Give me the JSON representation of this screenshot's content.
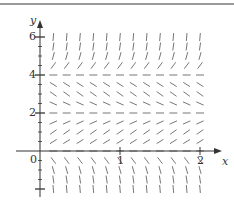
{
  "figure": {
    "type": "slope_field",
    "top_rule_color": "#9a9a9a",
    "axis_color": "#333333",
    "segment_color": "#666666"
  },
  "axes": {
    "x_label": "x",
    "y_label": "y",
    "origin_label": "0",
    "x_ticks": [
      {
        "value": 1,
        "label": "1"
      },
      {
        "value": 2,
        "label": "2"
      }
    ],
    "y_ticks": [
      {
        "value": 2,
        "label": "2"
      },
      {
        "value": 4,
        "label": "4"
      },
      {
        "value": 6,
        "label": "6"
      }
    ],
    "y_minor_step": 0.5
  },
  "chart_data": {
    "type": "slope_field",
    "title": "",
    "xlabel": "x",
    "ylabel": "y",
    "equation": "dy/dx = y(y-2)(y-4)",
    "equilibria": [
      0,
      2,
      4
    ],
    "x_grid": {
      "start": 0.1667,
      "stop": 2.0,
      "step": 0.1667
    },
    "y_grid": {
      "start": -2,
      "stop": 6,
      "step": 0.5
    },
    "xlim": [
      0,
      2.3
    ],
    "ylim": [
      -2.4,
      6.6
    ],
    "x_ticks": [
      1,
      2
    ],
    "y_ticks": [
      2,
      4,
      6
    ],
    "grid": false,
    "legend": null
  }
}
